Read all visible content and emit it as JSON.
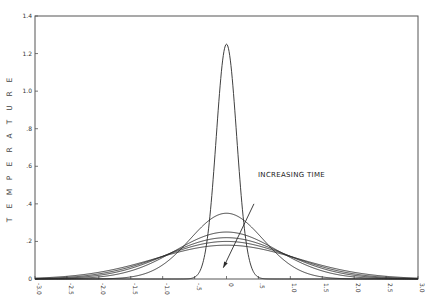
{
  "chart_data": {
    "type": "line",
    "title": "",
    "xlabel": "",
    "ylabel": "TEMPERATURE",
    "xlim": [
      -3.0,
      3.0
    ],
    "ylim": [
      0,
      1.4
    ],
    "grid": false,
    "legend": null,
    "x_ticks": [
      -3.0,
      -2.5,
      -2.0,
      -1.5,
      -1.0,
      -0.5,
      0,
      0.5,
      1.0,
      1.5,
      2.0,
      2.5,
      3.0
    ],
    "x_tick_labels": [
      "-3.0",
      "-2.5",
      "-2.0",
      "-1.5",
      "-1.0",
      "-.5",
      "0",
      ".5",
      "1.0",
      "1.5",
      "2.0",
      "2.5",
      "3.0"
    ],
    "y_ticks": [
      0,
      0.2,
      0.4,
      0.6,
      0.8,
      1.0,
      1.2,
      1.4
    ],
    "y_tick_labels": [
      "0",
      ".2",
      ".4",
      ".6",
      ".8",
      "1.0",
      "1.2",
      "1.4"
    ],
    "series": [
      {
        "name": "t1",
        "shape": "gaussian",
        "center": 0,
        "peak": 1.25,
        "sigma": 0.16
      },
      {
        "name": "t2",
        "shape": "gaussian",
        "center": 0,
        "peak": 0.35,
        "sigma": 0.57
      },
      {
        "name": "t3",
        "shape": "gaussian",
        "center": 0,
        "peak": 0.25,
        "sigma": 0.8
      },
      {
        "name": "t4",
        "shape": "gaussian",
        "center": 0,
        "peak": 0.22,
        "sigma": 0.91
      },
      {
        "name": "t5",
        "shape": "gaussian",
        "center": 0,
        "peak": 0.2,
        "sigma": 1.0
      },
      {
        "name": "t6",
        "shape": "gaussian",
        "center": 0,
        "peak": 0.18,
        "sigma": 1.11
      }
    ],
    "annotations": [
      {
        "text": "INCREASING TIME",
        "x": 1.0,
        "y": 0.42,
        "arrow_from": [
          0.43,
          0.4
        ],
        "arrow_to": [
          -0.05,
          0.06
        ]
      }
    ]
  },
  "labels": {
    "ylabel": "TEMPERATURE",
    "annotation": "INCREASING TIME"
  },
  "colors": {
    "line": "#2a2a2a",
    "axis": "#555555",
    "background": "#ffffff"
  }
}
